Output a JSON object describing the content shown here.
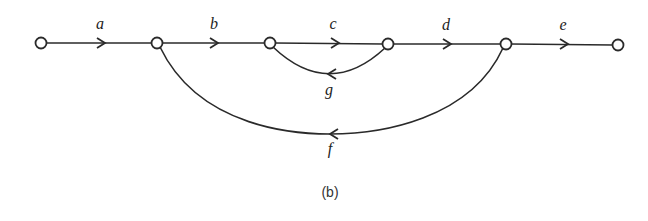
{
  "diagram": {
    "type": "signal-flow-graph",
    "caption": "(b)",
    "nodes": [
      {
        "id": "n1",
        "x": 41,
        "y": 43
      },
      {
        "id": "n2",
        "x": 157,
        "y": 43
      },
      {
        "id": "n3",
        "x": 270,
        "y": 43
      },
      {
        "id": "n4",
        "x": 388,
        "y": 44
      },
      {
        "id": "n5",
        "x": 506,
        "y": 44
      },
      {
        "id": "n6",
        "x": 618,
        "y": 45
      }
    ],
    "edges": [
      {
        "label": "a",
        "from": "n1",
        "to": "n2",
        "direction": "forward"
      },
      {
        "label": "b",
        "from": "n2",
        "to": "n3",
        "direction": "forward"
      },
      {
        "label": "c",
        "from": "n3",
        "to": "n4",
        "direction": "forward"
      },
      {
        "label": "d",
        "from": "n4",
        "to": "n5",
        "direction": "forward"
      },
      {
        "label": "e",
        "from": "n5",
        "to": "n6",
        "direction": "forward"
      },
      {
        "label": "g",
        "from": "n4",
        "to": "n3",
        "direction": "feedback"
      },
      {
        "label": "f",
        "from": "n5",
        "to": "n2",
        "direction": "feedback"
      }
    ],
    "stroke_color": "#2a2a2a"
  }
}
